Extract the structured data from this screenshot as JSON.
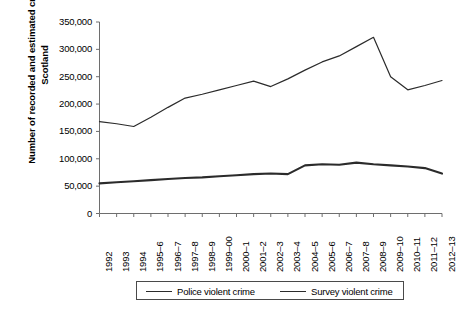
{
  "chart_data": {
    "type": "line",
    "title": "",
    "xlabel": "",
    "ylabel": "Number of recorded and estimated crimes in Scotland",
    "ylim": [
      0,
      350000
    ],
    "ytick_labels": [
      "0",
      "50,000",
      "100,000",
      "150,000",
      "200,000",
      "250,000",
      "300,000",
      "350,000"
    ],
    "ytick_values": [
      0,
      50000,
      100000,
      150000,
      200000,
      250000,
      300000,
      350000
    ],
    "grid": false,
    "legend_position": "bottom",
    "categories": [
      "1992",
      "1993",
      "1994",
      "1995–6",
      "1996–7",
      "1997–8",
      "1998–9",
      "1999–00",
      "2000–1",
      "2001–2",
      "2002–3",
      "2003–4",
      "2004–5",
      "2005–6",
      "2006–7",
      "2007–8",
      "2008–9",
      "2009–10",
      "2010–11",
      "2011–12",
      "2012–13"
    ],
    "series": [
      {
        "name": "Police violent crime",
        "values": [
          55000,
          57000,
          59000,
          61000,
          63000,
          65000,
          66000,
          68000,
          70000,
          72000,
          73000,
          72000,
          88000,
          90000,
          89000,
          93000,
          90000,
          88000,
          86000,
          83000,
          73000
        ]
      },
      {
        "name": "Survey violent crime",
        "values": [
          168000,
          164000,
          159000,
          176000,
          194000,
          211000,
          218000,
          226000,
          234000,
          242000,
          232000,
          246000,
          262000,
          277000,
          288000,
          305000,
          322000,
          250000,
          226000,
          234000,
          243000
        ]
      }
    ]
  },
  "legend": {
    "items": [
      {
        "label": "Police violent crime"
      },
      {
        "label": "Survey violent crime"
      }
    ]
  }
}
